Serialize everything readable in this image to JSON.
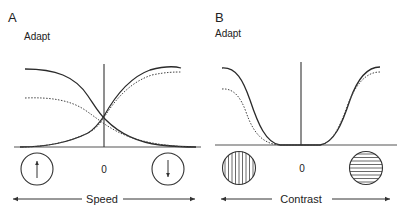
{
  "panels": [
    {
      "id": "A",
      "letter": "A",
      "ylabel": "Adapt",
      "zero_label": "0",
      "axis_label": "Speed",
      "left_stimulus": "upward-motion",
      "right_stimulus": "downward-motion"
    },
    {
      "id": "B",
      "letter": "B",
      "ylabel": "Adapt",
      "zero_label": "0",
      "axis_label": "Contrast",
      "left_stimulus": "vertical-grating",
      "right_stimulus": "horizontal-grating"
    }
  ],
  "colors": {
    "line": "#2a2a2a",
    "axis": "#555555",
    "background": "#ffffff"
  }
}
